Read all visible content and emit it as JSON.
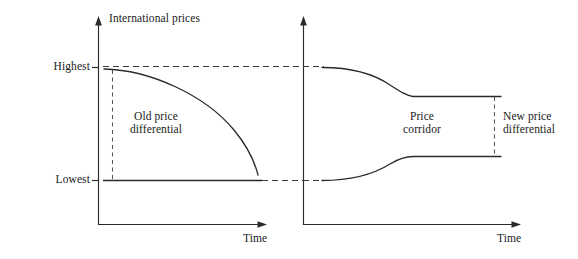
{
  "figure": {
    "type": "diagram",
    "background_color": "#ffffff",
    "ink_color": "#2b2b2b"
  },
  "panels": [
    {
      "id": "left-panel",
      "name": "old-price-differential-panel",
      "y_axis_title": "International prices",
      "x_axis_title": "Time",
      "y_ticks": [
        {
          "label": "Highest",
          "y_value": "highest"
        },
        {
          "label": "Lowest",
          "y_value": "lowest"
        }
      ],
      "annotation": "Old price\ndifferential",
      "annotation_line1": "Old price",
      "annotation_line2": "differential",
      "series": [
        {
          "name": "upper-price-curve",
          "style": "solid",
          "description": "starts at Highest, decays downward to Lowest"
        },
        {
          "name": "lower-price-line",
          "style": "solid",
          "description": "flat at Lowest across time"
        }
      ],
      "guides": [
        {
          "name": "highest-reference-line",
          "style": "dashed",
          "orientation": "horizontal"
        },
        {
          "name": "lowest-reference-line",
          "style": "dashed",
          "orientation": "horizontal"
        },
        {
          "name": "old-differential-measure",
          "style": "dashed",
          "orientation": "vertical"
        }
      ]
    },
    {
      "id": "right-panel",
      "name": "new-price-differential-panel",
      "y_axis_title": "",
      "x_axis_title": "Time",
      "annotation_corridor_line1": "Price",
      "annotation_corridor_line2": "corridor",
      "annotation_new_line1": "New price",
      "annotation_new_line2": "differential",
      "series": [
        {
          "name": "upper-price-curve",
          "style": "solid",
          "description": "starts at Highest, decays to an upper plateau, then flat"
        },
        {
          "name": "lower-price-curve",
          "style": "solid",
          "description": "starts at Lowest, rises to a lower plateau, then flat"
        }
      ],
      "guides": [
        {
          "name": "highest-reference-stub",
          "style": "dashed",
          "orientation": "horizontal"
        },
        {
          "name": "lowest-reference-stub",
          "style": "dashed",
          "orientation": "horizontal"
        },
        {
          "name": "new-differential-measure",
          "style": "dashed",
          "orientation": "vertical"
        }
      ]
    }
  ]
}
